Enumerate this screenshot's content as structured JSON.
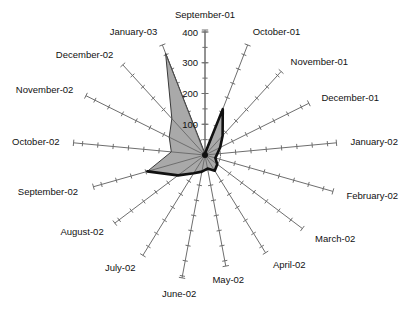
{
  "chart_data": {
    "type": "radar",
    "title": "",
    "subtitle": "",
    "xlabel": "",
    "ylabel": "",
    "grid": false,
    "legend": "none",
    "radial_axis": {
      "position": "top",
      "ticks": [
        0,
        100,
        200,
        300,
        400
      ],
      "tick_labels": [
        "0",
        "100",
        "200",
        "300",
        "400"
      ],
      "range": [
        0,
        400
      ],
      "minor_tick_interval": 50
    },
    "start_angle_deg": 90,
    "direction": "clockwise",
    "categories": [
      "September-01",
      "October-01",
      "November-01",
      "December-01",
      "January-02",
      "February-02",
      "March-02",
      "April-02",
      "May-02",
      "June-02",
      "July-02",
      "August-02",
      "September-02",
      "October-02",
      "November-02",
      "December-02",
      "January-03"
    ],
    "series": [
      {
        "name": "series-1",
        "values": [
          5,
          160,
          85,
          55,
          40,
          35,
          50,
          60,
          45,
          55,
          70,
          110,
          195,
          110,
          130,
          160,
          355
        ]
      }
    ]
  },
  "axis_labels": {
    "t0": "400",
    "t1": "300",
    "t2": "200",
    "t3": "100",
    "t4": "0"
  },
  "category_labels": {
    "c0": "September-01",
    "c1": "October-01",
    "c2": "November-01",
    "c3": "December-01",
    "c4": "January-02",
    "c5": "February-02",
    "c6": "March-02",
    "c7": "April-02",
    "c8": "May-02",
    "c9": "June-02",
    "c10": "July-02",
    "c11": "August-02",
    "c12": "September-02",
    "c13": "October-02",
    "c14": "November-02",
    "c15": "December-02",
    "c16": "January-03"
  },
  "colors": {
    "fill": "#a9a9a9",
    "outline_heavy": "#111111",
    "axis": "#6e6e6e",
    "text": "#111111",
    "background": "#ffffff"
  }
}
